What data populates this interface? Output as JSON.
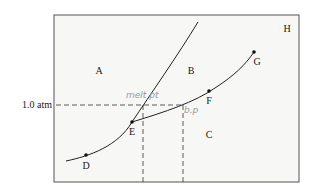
{
  "diagram": {
    "type": "phase-diagram",
    "pressure_label": "1.0 atm",
    "region_labels": [
      {
        "id": "A",
        "x": 99,
        "y": 74
      },
      {
        "id": "B",
        "x": 191,
        "y": 74
      },
      {
        "id": "C",
        "x": 209,
        "y": 138
      },
      {
        "id": "H",
        "x": 287,
        "y": 32
      }
    ],
    "points": [
      {
        "id": "D",
        "x": 86,
        "y": 155,
        "lx": 86,
        "ly": 169
      },
      {
        "id": "E",
        "x": 132,
        "y": 122,
        "lx": 132,
        "ly": 135
      },
      {
        "id": "F",
        "x": 209,
        "y": 91,
        "lx": 209,
        "ly": 104
      },
      {
        "id": "G",
        "x": 254,
        "y": 52,
        "lx": 257,
        "ly": 65
      }
    ],
    "annotations": [
      {
        "text": "melt pt",
        "x": 126,
        "y": 98
      },
      {
        "text": "b.p",
        "x": 184,
        "y": 113
      }
    ],
    "colors": {
      "line": "#222222",
      "frame": "#555555",
      "dash": "#333333",
      "pencil": "#9a9a9a",
      "background": "#f7f7f5"
    }
  }
}
